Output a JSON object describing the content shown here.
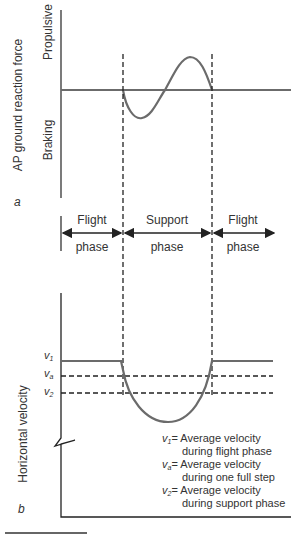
{
  "panel_a": {
    "letter": "a",
    "y_axis_label": "AP ground reaction force",
    "upper_label": "Propulsive",
    "lower_label": "Braking"
  },
  "phases": [
    {
      "top": "Flight",
      "bottom": "phase"
    },
    {
      "top": "Support",
      "bottom": "phase"
    },
    {
      "top": "Flight",
      "bottom": "phase"
    }
  ],
  "panel_b": {
    "letter": "b",
    "y_axis_label": "Horizontal velocity",
    "ticks": [
      {
        "sym": "v",
        "sub": "1"
      },
      {
        "sym": "v",
        "sub": "a"
      },
      {
        "sym": "v",
        "sub": "2"
      }
    ],
    "legend": [
      {
        "sym": "v",
        "sub": "1",
        "line1": "= Average velocity",
        "line2": "during flight phase"
      },
      {
        "sym": "v",
        "sub": "a",
        "line1": "= Average velocity",
        "line2": "during one full step"
      },
      {
        "sym": "v",
        "sub": "2",
        "line1": "= Average velocity",
        "line2": "during support phase"
      }
    ]
  },
  "colors": {
    "curve": "#6b6b6b",
    "axis": "#222222",
    "text": "#333333"
  }
}
